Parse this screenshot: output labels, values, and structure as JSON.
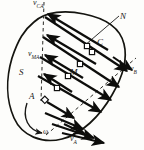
{
  "figure": {
    "kind": "mechanics-velocity-distribution-diagram",
    "canvas": {
      "width": 144,
      "height": 150
    },
    "colors": {
      "ink": "#1a1a18",
      "paper": "#fdfdfb",
      "outline": "#14140f",
      "arrow": "#0d0d0b",
      "dashed": "#2b2b26",
      "marker_fill": "#ffffff"
    }
  },
  "labels": {
    "v_ca": {
      "base": "v",
      "sub": "CA"
    },
    "v_ma": {
      "base": "v",
      "sub": "MA"
    },
    "v_a": {
      "base": "v",
      "sub": "A"
    },
    "v_b": {
      "base": "v",
      "sub": "B"
    },
    "point_n": "N",
    "point_c": "C",
    "point_m": "M",
    "point_a": "A",
    "body_s": "S",
    "omega": "ω"
  },
  "geometry": {
    "body_outline": "M 34,22 C 46,11 66,10 84,14 C 104,18 120,27 124,44 C 128,60 122,78 112,95 C 100,116 82,134 62,139 C 42,144 22,136 14,118 C 6,100 6,78 12,58 C 18,40 24,30 34,22 Z",
    "vertical_dashed": {
      "x1": 44,
      "y1": 3,
      "x2": 41,
      "y2": 100
    },
    "diagonal_dashed": {
      "x1": 48,
      "y1": 133,
      "x2": 133,
      "y2": 60
    },
    "normal_line_n": {
      "x1": 119,
      "y1": 16,
      "x2": 85,
      "y2": 45
    },
    "omega_arc": {
      "path": "M 27,104 C 23,118 29,130 44,133",
      "arrow_at": [
        44,
        133
      ]
    },
    "pole": {
      "x": 45,
      "y": 100,
      "label": "A"
    },
    "markers": [
      {
        "x": 45,
        "y": 100,
        "name": "marker-a"
      },
      {
        "x": 57,
        "y": 88,
        "name": "marker-1"
      },
      {
        "x": 68,
        "y": 76,
        "name": "marker-m"
      },
      {
        "x": 80,
        "y": 64,
        "name": "marker-2"
      },
      {
        "x": 92,
        "y": 52,
        "name": "marker-3"
      },
      {
        "x": 104,
        "y": 40,
        "name": "marker-c"
      }
    ],
    "relative_velocity_arrows_up": [
      {
        "x1": 70,
        "y1": 90,
        "x2": 43,
        "y2": 73
      },
      {
        "x1": 80,
        "y1": 76,
        "x2": 45,
        "y2": 54
      },
      {
        "x1": 94,
        "y1": 63,
        "x2": 47,
        "y2": 34
      },
      {
        "x1": 106,
        "y1": 49,
        "x2": 48,
        "y2": 14
      }
    ],
    "absolute_velocity_arrows_down": [
      {
        "x1": 48,
        "y1": 101,
        "x2": 76,
        "y2": 119
      },
      {
        "x1": 44,
        "y1": 112,
        "x2": 84,
        "y2": 130
      },
      {
        "x1": 52,
        "y1": 124,
        "x2": 96,
        "y2": 139
      },
      {
        "x1": 62,
        "y1": 133,
        "x2": 106,
        "y2": 143
      }
    ],
    "chord_arrows": [
      {
        "x1": 38,
        "y1": 74,
        "x2": 104,
        "y2": 113
      },
      {
        "x1": 40,
        "y1": 56,
        "x2": 114,
        "y2": 101
      },
      {
        "x1": 43,
        "y1": 36,
        "x2": 122,
        "y2": 88
      },
      {
        "x1": 45,
        "y1": 16,
        "x2": 130,
        "y2": 72
      }
    ],
    "v_b_arrow": {
      "x1": 112,
      "y1": 56,
      "x2": 133,
      "y2": 71
    },
    "v_a_arrow": {
      "x1": 62,
      "y1": 122,
      "x2": 86,
      "y2": 135
    }
  }
}
